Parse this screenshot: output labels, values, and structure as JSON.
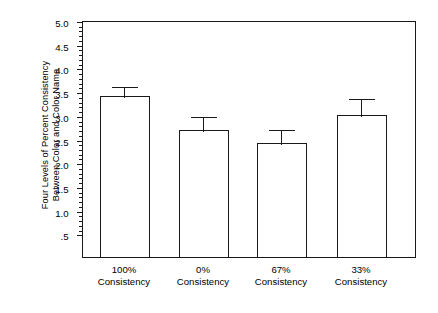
{
  "chart_data": {
    "type": "bar",
    "title": "",
    "xlabel": "",
    "ylabel": "Four Levels of Percent Consistency Between Color and Color Name",
    "ylabel_line1": "Four Levels of Percent Consistency",
    "ylabel_line2": "Between Color and Color Name",
    "categories": [
      "100% Consistency",
      "0% Consistency",
      "67% Consistency",
      "33% Consistency"
    ],
    "category_lines": [
      {
        "line1": "100%",
        "line2": "Consistency"
      },
      {
        "line1": "0%",
        "line2": "Consistency"
      },
      {
        "line1": "67%",
        "line2": "Consistency"
      },
      {
        "line1": "33%",
        "line2": "Consistency"
      }
    ],
    "values": [
      3.4,
      2.67,
      2.4,
      3.0
    ],
    "error_upper": [
      0.23,
      0.33,
      0.33,
      0.37
    ],
    "error_top_values": [
      3.63,
      3.0,
      2.73,
      3.37
    ],
    "ylim": [
      0.0,
      5.0
    ],
    "ytick_labels": [
      "5.0",
      "4.5",
      "4.0",
      "3.5",
      "3.0",
      "2.5",
      "2.0",
      "1.5",
      "1.0",
      ".5"
    ],
    "ytick_values": [
      5.0,
      4.5,
      4.0,
      3.5,
      3.0,
      2.5,
      2.0,
      1.5,
      1.0,
      0.5
    ],
    "minor_tick_step": 0.1,
    "grid": false,
    "legend": null,
    "bar_fill": "#ffffff",
    "bar_stroke": "#1a1a1a",
    "axis_color": "#1a1a1a"
  }
}
